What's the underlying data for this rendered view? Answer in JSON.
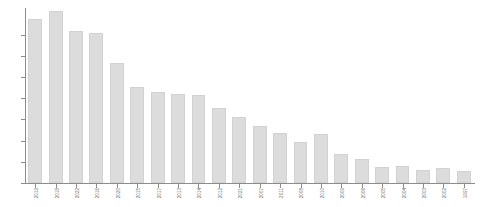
{
  "chart_data": {
    "type": "bar",
    "title": "",
    "subtitle": "",
    "xlabel": "",
    "ylabel": "",
    "grid": false,
    "legend": "none",
    "bar_color": "#dcdcdc",
    "axis_color": "#8c8c8c",
    "background": "#ffffff",
    "ylim": [
      0,
      165
    ],
    "yticks": [
      0,
      20,
      40,
      60,
      80,
      100,
      120,
      140
    ],
    "ytick_labels": [
      "0",
      "20",
      "40",
      "60",
      "80",
      "100",
      "120",
      "140"
    ],
    "categories": [
      "2019",
      "2018",
      "2022",
      "2016",
      "2020",
      "2015",
      "2017",
      "2013",
      "2014",
      "2012",
      "2021",
      "2007",
      "2011",
      "2008",
      "2010",
      "2009",
      "2006",
      "2005",
      "2004",
      "2003",
      "2002",
      "1997"
    ],
    "values": [
      155,
      162,
      143,
      141,
      113,
      91,
      86,
      84,
      83,
      71,
      62,
      54,
      47,
      39,
      46,
      27,
      23,
      15,
      16,
      12,
      14,
      11
    ]
  }
}
